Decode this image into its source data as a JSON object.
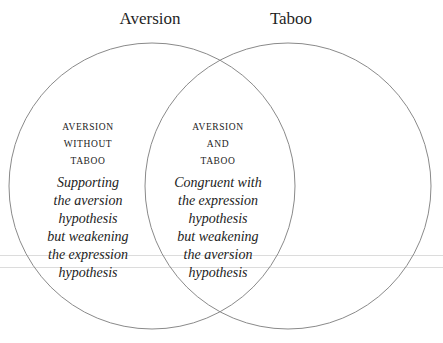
{
  "diagram": {
    "type": "venn",
    "sets": [
      {
        "label": "Aversion"
      },
      {
        "label": "Taboo"
      }
    ],
    "regions": [
      {
        "id": "aversion-only",
        "heading_lines": [
          "AVERSION",
          "WITHOUT",
          "TABOO"
        ],
        "description_lines": [
          "Supporting",
          "the aversion",
          "hypothesis",
          "but weakening",
          "the expression",
          "hypothesis"
        ]
      },
      {
        "id": "intersection",
        "heading_lines": [
          "AVERSION",
          "AND",
          "TABOO"
        ],
        "description_lines": [
          "Congruent with",
          "the expression",
          "hypothesis",
          "but weakening",
          "the aversion",
          "hypothesis"
        ]
      }
    ],
    "colors": {
      "circle_stroke": "#8a8a8a",
      "guide_line": "#dcdcdc",
      "text": "#222222"
    }
  }
}
